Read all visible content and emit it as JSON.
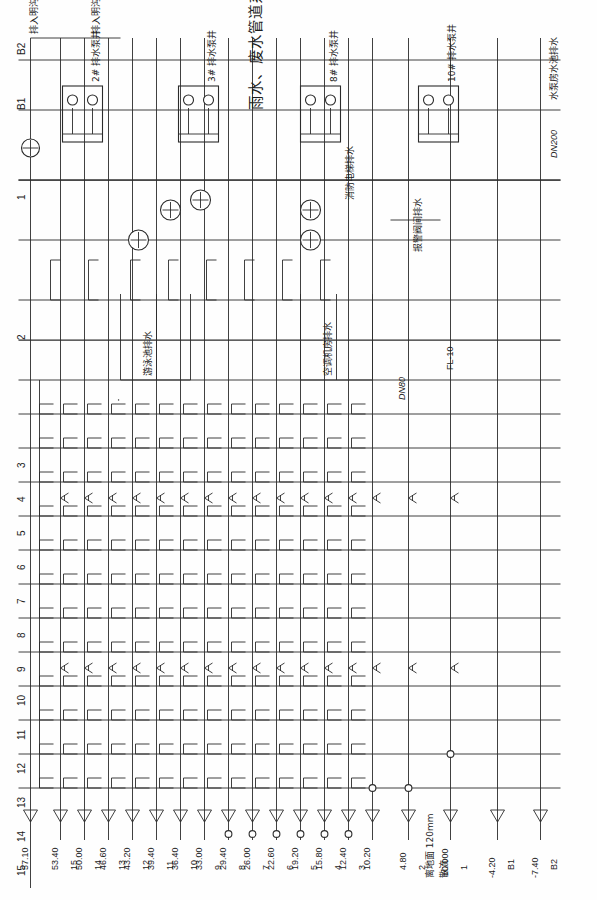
{
  "drawing": {
    "title": "雨水、废水管道系统图",
    "sheet_note": "Rainwater & Wastewater Piping System Riser Diagram",
    "top_level_label": "57.10"
  },
  "levels": [
    {
      "floor": "15",
      "elev": "53.40"
    },
    {
      "floor": "14",
      "elev": "50.00"
    },
    {
      "floor": "13",
      "elev": "46.60"
    },
    {
      "floor": "12",
      "elev": "43.20"
    },
    {
      "floor": "11",
      "elev": "39.40"
    },
    {
      "floor": "10",
      "elev": "36.40"
    },
    {
      "floor": "9",
      "elev": "33.00"
    },
    {
      "floor": "8",
      "elev": "29.40"
    },
    {
      "floor": "7",
      "elev": "26.00"
    },
    {
      "floor": "6",
      "elev": "22.60"
    },
    {
      "floor": "5",
      "elev": "19.20"
    },
    {
      "floor": "4",
      "elev": "15.80"
    },
    {
      "floor": "3",
      "elev": "12.40"
    },
    {
      "floor": "",
      "elev": "10.20"
    },
    {
      "floor": "2",
      "elev": "4.80"
    },
    {
      "floor": "1",
      "elev": "±0.000"
    },
    {
      "floor": "B1",
      "elev": "-4.20"
    },
    {
      "floor": "B2",
      "elev": "-7.40"
    }
  ],
  "column_numbers": [
    "15",
    "14",
    "13",
    "12",
    "11",
    "10",
    "9",
    "8",
    "7",
    "6",
    "5",
    "4",
    "3",
    "2",
    "1"
  ],
  "basement_axes": [
    "B1",
    "B2"
  ],
  "annotations": {
    "ground_clearance": "离地面 120mm",
    "ground_spread": "散流",
    "pool_drain": "水泵房水池排水",
    "pool_drain_size": "DN200",
    "swimming_pool_drain": "游泳池排水",
    "hvac_room_drain": "空调机房排水",
    "alarm_valve_room_drain": "报警阀间排水",
    "fire_elevator_drain": "消防电梯排水",
    "discharge_to_ditch_1": "排入明沟",
    "discharge_to_ditch_2": "排入明沟",
    "riser_fl10": "FL-10",
    "pipe_dn80": "DN80"
  },
  "pump_wells": [
    {
      "label": "2# 排水泵井"
    },
    {
      "label": "3# 排水泵井"
    },
    {
      "label": "8# 排水泵井"
    },
    {
      "label": "10# 排水泵井"
    }
  ],
  "pump_tags": [
    "排水泵",
    "排水泵",
    "排水泵",
    "排水泵",
    "排水泵",
    "排水泵"
  ],
  "colors": {
    "line": "#2b2b2b",
    "paper": "#fefefe",
    "text": "#1c1c1c"
  }
}
